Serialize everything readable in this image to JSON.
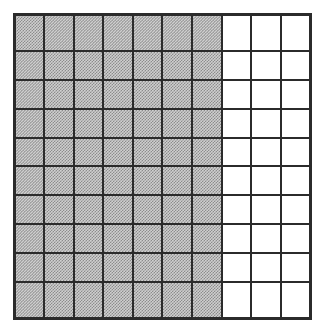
{
  "figure": {
    "name": "hundred-grid",
    "rows": 10,
    "columns": 10,
    "total_cells": 100,
    "shaded_cells": 70,
    "unshaded_cells": 30,
    "shaded_columns_per_row": 7,
    "unshaded_columns_per_row": 3,
    "fraction_shaded": "70/100",
    "percent_shaded": "70%",
    "decimal_shaded": "0.7"
  },
  "colors": {
    "grid_line": "#2b2b2b",
    "border": "#2b2b2b",
    "shaded_fill": "#cfcfcf",
    "shaded_dither_dark": "#8c8c8c",
    "unshaded_fill": "#ffffff",
    "page_background": "#ffffff"
  },
  "chart_data": {
    "type": "heatmap",
    "title": "",
    "xlabel": "",
    "ylabel": "",
    "grid": true,
    "legend": null,
    "categories": [
      "c1",
      "c2",
      "c3",
      "c4",
      "c5",
      "c6",
      "c7",
      "c8",
      "c9",
      "c10"
    ],
    "row_labels": [
      "r1",
      "r2",
      "r3",
      "r4",
      "r5",
      "r6",
      "r7",
      "r8",
      "r9",
      "r10"
    ],
    "values": [
      [
        1,
        1,
        1,
        1,
        1,
        1,
        1,
        0,
        0,
        0
      ],
      [
        1,
        1,
        1,
        1,
        1,
        1,
        1,
        0,
        0,
        0
      ],
      [
        1,
        1,
        1,
        1,
        1,
        1,
        1,
        0,
        0,
        0
      ],
      [
        1,
        1,
        1,
        1,
        1,
        1,
        1,
        0,
        0,
        0
      ],
      [
        1,
        1,
        1,
        1,
        1,
        1,
        1,
        0,
        0,
        0
      ],
      [
        1,
        1,
        1,
        1,
        1,
        1,
        1,
        0,
        0,
        0
      ],
      [
        1,
        1,
        1,
        1,
        1,
        1,
        1,
        0,
        0,
        0
      ],
      [
        1,
        1,
        1,
        1,
        1,
        1,
        1,
        0,
        0,
        0
      ],
      [
        1,
        1,
        1,
        1,
        1,
        1,
        1,
        0,
        0,
        0
      ],
      [
        1,
        1,
        1,
        1,
        1,
        1,
        1,
        0,
        0,
        0
      ]
    ],
    "value_meaning": {
      "1": "shaded",
      "0": "unshaded"
    }
  }
}
